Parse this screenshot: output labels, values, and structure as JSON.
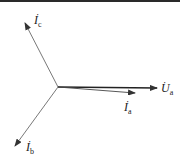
{
  "diagram": {
    "type": "phasor-diagram",
    "origin": {
      "x": 58,
      "y": 85
    },
    "colors": {
      "line": "#333333",
      "text": "#222222",
      "background": "#ffffff",
      "top_border": "#2a2a2a"
    },
    "phasors": [
      {
        "id": "Ic",
        "symbol": "I",
        "dot": "·",
        "subscript": "c",
        "tip": {
          "x": 25,
          "y": 21
        }
      },
      {
        "id": "Ua",
        "symbol": "U",
        "dot": "·",
        "subscript": "a",
        "tip": {
          "x": 157,
          "y": 86
        }
      },
      {
        "id": "Ia",
        "symbol": "I",
        "dot": "·",
        "subscript": "a",
        "tip": {
          "x": 135,
          "y": 91
        }
      },
      {
        "id": "Ib",
        "symbol": "I",
        "dot": "·",
        "subscript": "b",
        "tip": {
          "x": 15,
          "y": 144
        }
      }
    ]
  }
}
